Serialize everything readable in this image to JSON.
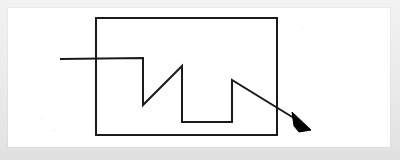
{
  "document": {
    "kind": "scanned-diagram",
    "page_background": "#ffffff",
    "frame_background": "#eaeaea",
    "ink_color": "#1a1a1a",
    "stroke_width": 2
  },
  "diagram": {
    "title": "Signal path crossing a rectangular boundary",
    "shapes": [
      {
        "name": "boundary-rectangle",
        "type": "rect",
        "x": 88,
        "y": 10,
        "width": 181,
        "height": 117,
        "stroke": "#1a1a1a",
        "stroke_width": 2,
        "fill": "none"
      },
      {
        "name": "signal-polyline",
        "type": "polyline",
        "stroke": "#1a1a1a",
        "stroke_width": 2,
        "fill": "none",
        "points": "52,51 135,50 135,97 174,58 174,114 224,114 224,72 294,115"
      },
      {
        "name": "arrowhead",
        "type": "polygon",
        "fill": "#000000",
        "points": "284,104 303,122 291,124 286,118"
      }
    ]
  },
  "geometry_notes": {
    "rect_top_left": "96,18",
    "rect_bottom_right": "277,135",
    "line_entry_x": 60,
    "line_entry_y": 59,
    "arrow_tip_x": 311,
    "arrow_tip_y": 130
  }
}
